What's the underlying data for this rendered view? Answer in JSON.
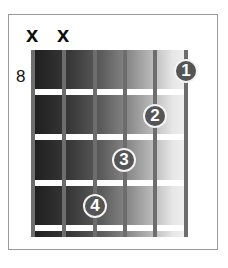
{
  "chord_diagram": {
    "starting_fret": "8",
    "strings": 6,
    "frets_shown": 4,
    "muted_strings": [
      {
        "string": 1,
        "symbol": "x"
      },
      {
        "string": 2,
        "symbol": "x"
      }
    ],
    "fingers": [
      {
        "label": "1",
        "string": 6,
        "fret": 1
      },
      {
        "label": "2",
        "string": 5,
        "fret": 2
      },
      {
        "label": "3",
        "string": 4,
        "fret": 3
      },
      {
        "label": "4",
        "string": 3,
        "fret": 4
      }
    ],
    "colors": {
      "finger_fill": "#555555",
      "finger_outline": "#f3f3f3",
      "string": "#6d6d6d",
      "fret": "#ffffff",
      "frame": "#9a9a9a"
    }
  }
}
